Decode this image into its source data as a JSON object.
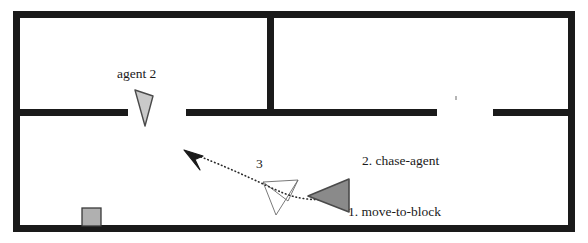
{
  "figure": {
    "type": "floorplan-trajectory-diagram",
    "width": 588,
    "height": 243,
    "background_color": "#ffffff"
  },
  "colors": {
    "wall": "#1a1a1a",
    "agent_primary_fill": "#8a8a8a",
    "agent_primary_stroke": "#4a4a4a",
    "agent_secondary_fill": "#c9c9c9",
    "agent_secondary_stroke": "#4a4a4a",
    "block_fill": "#b0b0b0",
    "block_stroke": "#3a3a3a",
    "trajectory": "#2a2a2a",
    "sensor_cone_stroke": "#6a6a6a",
    "text": "#1a1a1a"
  },
  "labels": {
    "agent_2": "agent 2",
    "step_1": "1. move-to-block",
    "step_2": "2. chase-agent",
    "step_3": "3"
  },
  "entities": {
    "agent_primary": {
      "name": "agent 1",
      "heading": "left",
      "points": "348,180 348,212 309,196",
      "fill": "#8a8a8a"
    },
    "agent_secondary": {
      "name": "agent 2",
      "heading": "down",
      "points": "135,90 153,96 145,126",
      "fill": "#c9c9c9"
    },
    "block": {
      "name": "block",
      "x": 82,
      "y": 208,
      "width": 19,
      "height": 18,
      "fill": "#b0b0b0"
    }
  },
  "trajectory": {
    "style": "dotted",
    "path": "M 348,196 C 320,203 296,199 281,192 C 266,186 240,172 196,155",
    "arrowhead_points": "186,151 201,156 196,159 200,168"
  },
  "sensor_cone": {
    "style": "thin-outline",
    "apex": "263,182",
    "points": "263,182 298,180 288,201 263,182 276,215 298,180"
  },
  "walls": [
    {
      "name": "top-wall",
      "x": 13,
      "y": 11,
      "w": 562,
      "h": 7
    },
    {
      "name": "left-wall",
      "x": 13,
      "y": 11,
      "w": 7,
      "h": 221
    },
    {
      "name": "right-wall",
      "x": 568,
      "y": 11,
      "w": 7,
      "h": 221
    },
    {
      "name": "bottom-wall",
      "x": 13,
      "y": 225,
      "w": 562,
      "h": 7
    },
    {
      "name": "interior-wall-left",
      "x": 13,
      "y": 109,
      "w": 115,
      "h": 7
    },
    {
      "name": "interior-wall-mid",
      "x": 186,
      "y": 109,
      "w": 251,
      "h": 7
    },
    {
      "name": "interior-wall-right",
      "x": 493,
      "y": 109,
      "w": 82,
      "h": 7
    },
    {
      "name": "interior-wall-vertical",
      "x": 267,
      "y": 11,
      "w": 7,
      "h": 102
    }
  ],
  "doorways": [
    {
      "name": "doorway-left",
      "x": 128,
      "y": 109,
      "w": 58
    },
    {
      "name": "doorway-right",
      "x": 437,
      "y": 109,
      "w": 56
    }
  ]
}
